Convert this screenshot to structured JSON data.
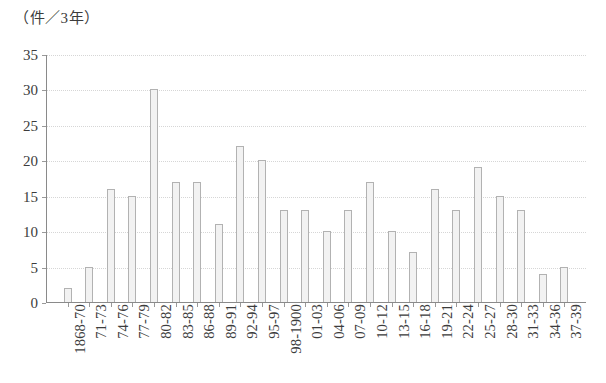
{
  "chart_data": {
    "type": "bar",
    "title": "（件／3年）",
    "xlabel": "",
    "ylabel": "",
    "ylim": [
      0,
      35
    ],
    "yticks": [
      0,
      5,
      10,
      15,
      20,
      25,
      30,
      35
    ],
    "grid": true,
    "legend": "none",
    "categories": [
      "1868-70",
      "71-73",
      "74-76",
      "77-79",
      "80-82",
      "83-85",
      "86-88",
      "89-91",
      "92-94",
      "95-97",
      "98-1900",
      "01-03",
      "04-06",
      "07-09",
      "10-12",
      "13-15",
      "16-18",
      "19-21",
      "22-24",
      "25-27",
      "28-30",
      "31-33",
      "34-36",
      "37-39"
    ],
    "values": [
      2,
      5,
      16,
      15,
      30,
      17,
      17,
      11,
      22,
      20,
      13,
      13,
      10,
      13,
      17,
      10,
      7,
      16,
      13,
      19,
      15,
      13,
      4,
      5
    ]
  },
  "style": {
    "bar_fill": "#f2f2f2",
    "bar_border": "#b2b2b2",
    "axis_color": "#8a8a8a",
    "grid_color": "#d6d6d6",
    "text_color": "#3c3c3c",
    "background": "#ffffff"
  }
}
